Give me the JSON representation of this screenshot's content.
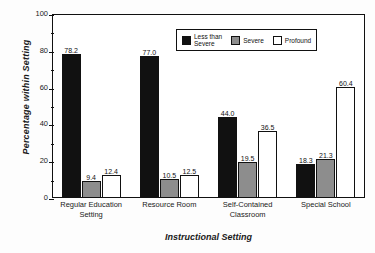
{
  "chart_data": {
    "type": "bar",
    "title": "",
    "xlabel": "Instructional Setting",
    "ylabel": "Percentage within Setting",
    "categories": [
      "Regular Education\nSetting",
      "Resource Room",
      "Self-Contained\nClassroom",
      "Special School"
    ],
    "series": [
      {
        "name": "Less than\nSevere",
        "legend_label": "Less than\nSevere",
        "color": "#111111",
        "values": [
          78.2,
          77.0,
          44.0,
          18.3
        ]
      },
      {
        "name": "Severe",
        "legend_label": "Severe",
        "color": "#8d8d8d",
        "values": [
          9.4,
          10.5,
          19.5,
          21.3
        ]
      },
      {
        "name": "Profound",
        "legend_label": "Profound",
        "color": "#ffffff",
        "values": [
          12.4,
          12.5,
          36.5,
          60.4
        ]
      }
    ],
    "ylim": [
      0,
      100
    ],
    "yticks": [
      0,
      20,
      40,
      60,
      80,
      100
    ],
    "ytick_labels": [
      "0",
      "20",
      "40",
      "60",
      "80",
      "100"
    ],
    "value_labels": [
      [
        "78.2",
        "9.4",
        "12.4"
      ],
      [
        "77.0",
        "10.5",
        "12.5"
      ],
      [
        "44.0",
        "19.5",
        "36.5"
      ],
      [
        "18.3",
        "21.3",
        "60.4"
      ]
    ],
    "grid": false,
    "legend_position": "upper center"
  }
}
